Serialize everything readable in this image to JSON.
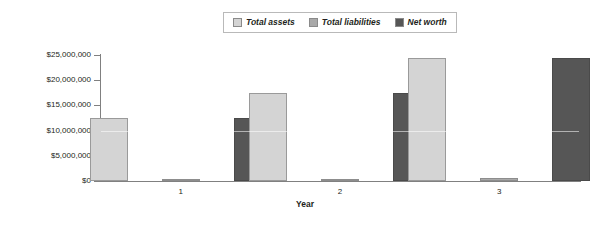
{
  "chart_data": {
    "type": "bar",
    "title": "",
    "xlabel": "Year",
    "ylabel": "",
    "categories": [
      "1",
      "2",
      "3"
    ],
    "series": [
      {
        "name": "Total assets",
        "color": "#d4d4d4",
        "values": [
          12500000,
          17500000,
          24500000
        ]
      },
      {
        "name": "Total liabilities",
        "color": "#a9a9a9",
        "values": [
          150000,
          150000,
          600000
        ]
      },
      {
        "name": "Net worth",
        "color": "#565656",
        "values": [
          12500000,
          17500000,
          24400000
        ]
      }
    ],
    "ylim": [
      0,
      25000000
    ],
    "ytick_values": [
      0,
      5000000,
      10000000,
      15000000,
      20000000,
      25000000
    ],
    "ytick_labels": [
      "$0",
      "$5,000,000",
      "$10,000,000",
      "$15,000,000",
      "$20,000,000",
      "$25,000,000"
    ],
    "grid": false,
    "legend_position": "top-center"
  },
  "legend": {
    "entries": [
      {
        "label": "Total assets"
      },
      {
        "label": "Total liabilities"
      },
      {
        "label": "Net worth"
      }
    ]
  },
  "axis": {
    "x_title": "Year"
  }
}
